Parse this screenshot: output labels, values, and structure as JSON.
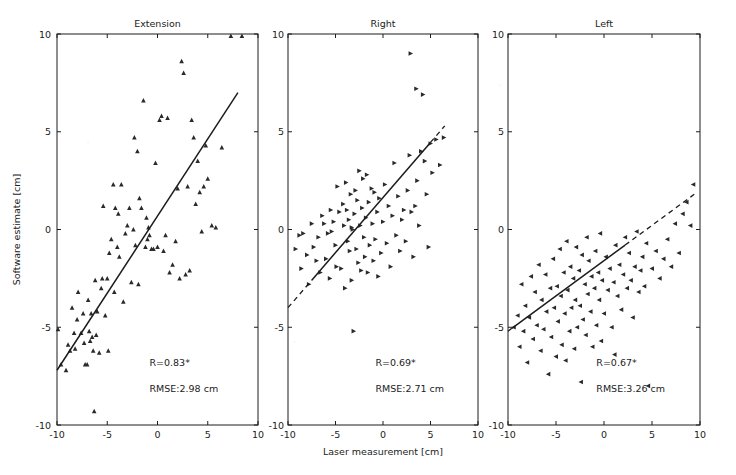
{
  "figure": {
    "width": 736,
    "height": 475,
    "background": "#ffffff",
    "ink_color": "#222222"
  },
  "axis": {
    "xlabel": "Laser measurement [cm]",
    "ylabel": "Software estimate [cm]",
    "xticks": [
      "-10",
      "-5",
      "0",
      "5",
      "10"
    ],
    "yticks": [
      "10",
      "5",
      "0",
      "-5",
      "-10"
    ],
    "xlim": [
      -10,
      10
    ],
    "ylim": [
      -10,
      10
    ]
  },
  "chart_data": {
    "type": "scatter",
    "title": "",
    "xlabel": "Laser measurement [cm]",
    "ylabel": "Software estimate [cm]",
    "xlim": [
      -10,
      10
    ],
    "ylim": [
      -10,
      10
    ],
    "grid": false,
    "legend": "none",
    "shared_axes": true,
    "panels": [
      {
        "title": "Extension",
        "marker": "triangle-up",
        "marker_color": "#2a2a2a",
        "r_label": "R=0.83*",
        "rmse_label": "RMSE:2.98 cm",
        "r_value": 0.83,
        "rmse_value": 2.98,
        "rmse_units": "cm",
        "significance": "*",
        "fit_line": {
          "style": "solid",
          "x_start": -10.0,
          "y_start": -7.2,
          "x_end": 8.0,
          "y_end": 7.0,
          "slope": 0.789,
          "intercept": 0.69
        },
        "points": [
          [
            -9.9,
            -5.1
          ],
          [
            -9.6,
            -6.9
          ],
          [
            -9.1,
            -7.2
          ],
          [
            -8.9,
            -5.9
          ],
          [
            -8.7,
            -6.2
          ],
          [
            -8.5,
            -4.0
          ],
          [
            -8.3,
            -5.3
          ],
          [
            -8.2,
            -6.1
          ],
          [
            -8.0,
            -4.6
          ],
          [
            -7.9,
            -3.2
          ],
          [
            -7.6,
            -5.3
          ],
          [
            -7.4,
            -4.3
          ],
          [
            -7.3,
            -5.8
          ],
          [
            -7.2,
            -6.9
          ],
          [
            -7.0,
            -6.9
          ],
          [
            -6.9,
            -3.6
          ],
          [
            -6.8,
            -5.2
          ],
          [
            -6.7,
            -5.7
          ],
          [
            -6.6,
            -4.3
          ],
          [
            -6.5,
            -5.5
          ],
          [
            -6.4,
            -6.2
          ],
          [
            -6.3,
            -9.3
          ],
          [
            -6.2,
            -2.6
          ],
          [
            -6.1,
            -5.4
          ],
          [
            -6.0,
            -4.2
          ],
          [
            -5.8,
            -6.3
          ],
          [
            -5.6,
            -3.0
          ],
          [
            -5.5,
            -2.5
          ],
          [
            -5.4,
            1.2
          ],
          [
            -5.2,
            -4.4
          ],
          [
            -5.0,
            -2.5
          ],
          [
            -4.9,
            -6.2
          ],
          [
            -4.8,
            -1.2
          ],
          [
            -4.6,
            -0.5
          ],
          [
            -4.4,
            2.3
          ],
          [
            -4.3,
            -3.2
          ],
          [
            -4.2,
            1.1
          ],
          [
            -4.0,
            -0.9
          ],
          [
            -3.9,
            0.8
          ],
          [
            -3.8,
            -1.4
          ],
          [
            -3.6,
            2.3
          ],
          [
            -3.4,
            -3.7
          ],
          [
            -3.2,
            -0.2
          ],
          [
            -3.0,
            0.2
          ],
          [
            -2.8,
            1.1
          ],
          [
            -2.6,
            -2.7
          ],
          [
            -2.4,
            0.0
          ],
          [
            -2.3,
            4.7
          ],
          [
            -2.2,
            -0.8
          ],
          [
            -2.0,
            4.0
          ],
          [
            -1.9,
            -2.8
          ],
          [
            -1.8,
            1.6
          ],
          [
            -1.6,
            1.1
          ],
          [
            -1.4,
            6.6
          ],
          [
            -1.2,
            -0.9
          ],
          [
            -1.1,
            0.6
          ],
          [
            -1.0,
            -0.5
          ],
          [
            -0.9,
            0.1
          ],
          [
            -0.8,
            -0.3
          ],
          [
            -0.6,
            -1.0
          ],
          [
            -0.4,
            -1.0
          ],
          [
            -0.2,
            3.4
          ],
          [
            0.0,
            -0.9
          ],
          [
            0.2,
            5.6
          ],
          [
            0.4,
            5.8
          ],
          [
            0.6,
            -1.1
          ],
          [
            0.8,
            -0.3
          ],
          [
            1.0,
            5.7
          ],
          [
            1.2,
            -2.2
          ],
          [
            1.5,
            -1.8
          ],
          [
            1.8,
            -0.6
          ],
          [
            2.0,
            2.1
          ],
          [
            2.2,
            -2.5
          ],
          [
            2.4,
            8.6
          ],
          [
            2.6,
            8.0
          ],
          [
            2.8,
            -2.3
          ],
          [
            3.0,
            2.2
          ],
          [
            3.2,
            -2.1
          ],
          [
            3.4,
            5.6
          ],
          [
            3.6,
            4.7
          ],
          [
            3.8,
            1.3
          ],
          [
            4.0,
            3.5
          ],
          [
            4.2,
            1.9
          ],
          [
            4.4,
            -0.1
          ],
          [
            4.6,
            2.2
          ],
          [
            4.8,
            4.3
          ],
          [
            5.0,
            2.6
          ],
          [
            5.4,
            0.2
          ],
          [
            5.8,
            0.1
          ],
          [
            6.4,
            4.2
          ],
          [
            7.3,
            9.9
          ],
          [
            8.4,
            9.9
          ]
        ]
      },
      {
        "title": "Right",
        "marker": "triangle-right",
        "marker_color": "#2a2a2a",
        "r_label": "R=0.69*",
        "rmse_label": "RMSE:2.71 cm",
        "r_value": 0.69,
        "rmse_value": 2.71,
        "rmse_units": "cm",
        "significance": "*",
        "fit_line": {
          "style": "solid-with-dashed-extensions",
          "x_start": -10.0,
          "y_start": -4.0,
          "x_end": 6.5,
          "y_end": 5.3,
          "solid_x_start": -7.5,
          "solid_x_end": 5.0,
          "slope": 0.564,
          "intercept": 1.64
        },
        "points": [
          [
            -9.2,
            -1.0
          ],
          [
            -8.8,
            -0.3
          ],
          [
            -8.6,
            -2.0
          ],
          [
            -8.4,
            -0.2
          ],
          [
            -8.0,
            -1.3
          ],
          [
            -7.8,
            -2.8
          ],
          [
            -7.5,
            0.3
          ],
          [
            -7.3,
            -0.9
          ],
          [
            -7.0,
            -1.6
          ],
          [
            -6.8,
            -0.4
          ],
          [
            -6.6,
            -2.2
          ],
          [
            -6.4,
            0.7
          ],
          [
            -6.2,
            0.3
          ],
          [
            -6.0,
            -1.5
          ],
          [
            -5.8,
            -0.2
          ],
          [
            -5.6,
            -2.5
          ],
          [
            -5.5,
            1.0
          ],
          [
            -5.4,
            -0.1
          ],
          [
            -5.2,
            0.4
          ],
          [
            -5.0,
            -0.8
          ],
          [
            -4.9,
            -1.9
          ],
          [
            -4.8,
            2.2
          ],
          [
            -4.6,
            0.9
          ],
          [
            -4.4,
            -2.0
          ],
          [
            -4.2,
            1.3
          ],
          [
            -4.1,
            0.2
          ],
          [
            -4.0,
            -3.0
          ],
          [
            -3.9,
            2.4
          ],
          [
            -3.8,
            1.0
          ],
          [
            -3.7,
            -0.6
          ],
          [
            -3.6,
            0.5
          ],
          [
            -3.5,
            -1.1
          ],
          [
            -3.4,
            1.8
          ],
          [
            -3.3,
            -2.6
          ],
          [
            -3.2,
            0.0
          ],
          [
            -3.1,
            -5.2
          ],
          [
            -3.0,
            0.8
          ],
          [
            -2.9,
            2.0
          ],
          [
            -2.8,
            -1.0
          ],
          [
            -2.7,
            1.5
          ],
          [
            -2.6,
            -1.7
          ],
          [
            -2.5,
            3.0
          ],
          [
            -2.4,
            0.2
          ],
          [
            -2.3,
            -2.1
          ],
          [
            -2.2,
            1.1
          ],
          [
            -2.1,
            2.6
          ],
          [
            -2.0,
            -0.4
          ],
          [
            -1.9,
            -1.4
          ],
          [
            -1.8,
            0.6
          ],
          [
            -1.7,
            2.8
          ],
          [
            -1.6,
            -2.2
          ],
          [
            -1.5,
            1.4
          ],
          [
            -1.4,
            -0.8
          ],
          [
            -1.2,
            2.1
          ],
          [
            -1.1,
            0.3
          ],
          [
            -1.0,
            -1.6
          ],
          [
            -0.9,
            1.9
          ],
          [
            -0.8,
            -0.5
          ],
          [
            -0.6,
            0.9
          ],
          [
            -0.5,
            -2.4
          ],
          [
            -0.4,
            1.6
          ],
          [
            -0.2,
            -1.2
          ],
          [
            0.0,
            0.4
          ],
          [
            0.2,
            2.3
          ],
          [
            0.4,
            -0.7
          ],
          [
            0.6,
            1.2
          ],
          [
            0.8,
            -1.9
          ],
          [
            1.0,
            0.7
          ],
          [
            1.2,
            3.4
          ],
          [
            1.4,
            -0.3
          ],
          [
            1.6,
            1.7
          ],
          [
            1.8,
            -1.1
          ],
          [
            2.0,
            0.5
          ],
          [
            2.2,
            1.0
          ],
          [
            2.4,
            -0.6
          ],
          [
            2.6,
            2.0
          ],
          [
            2.8,
            3.8
          ],
          [
            3.0,
            0.9
          ],
          [
            3.2,
            -1.4
          ],
          [
            3.4,
            1.2
          ],
          [
            3.6,
            2.5
          ],
          [
            3.8,
            0.2
          ],
          [
            4.0,
            4.0
          ],
          [
            4.2,
            6.9
          ],
          [
            4.4,
            3.5
          ],
          [
            4.6,
            1.8
          ],
          [
            4.8,
            -0.9
          ],
          [
            5.0,
            4.4
          ],
          [
            5.2,
            2.9
          ],
          [
            5.6,
            4.6
          ],
          [
            6.0,
            3.3
          ],
          [
            6.4,
            4.7
          ],
          [
            2.9,
            9.0
          ],
          [
            3.5,
            7.2
          ],
          [
            -3.3,
            0.1
          ]
        ]
      },
      {
        "title": "Left",
        "marker": "triangle-left",
        "marker_color": "#2a2a2a",
        "r_label": "R=0.67*",
        "rmse_label": "RMSE:3.26 cm",
        "r_value": 0.67,
        "rmse_value": 3.26,
        "rmse_units": "cm",
        "significance": "*",
        "fit_line": {
          "style": "solid-with-dashed-extensions",
          "x_start": -10.0,
          "y_start": -5.2,
          "x_end": 9.4,
          "y_end": 1.8,
          "solid_x_start": -9.6,
          "solid_x_end": 2.2,
          "slope": 0.361,
          "intercept": -1.59
        },
        "points": [
          [
            -9.4,
            -5.0
          ],
          [
            -9.0,
            -4.4
          ],
          [
            -8.8,
            -6.0
          ],
          [
            -8.6,
            -2.8
          ],
          [
            -8.4,
            -5.2
          ],
          [
            -8.2,
            -3.9
          ],
          [
            -8.0,
            -6.8
          ],
          [
            -7.8,
            -4.5
          ],
          [
            -7.6,
            -2.4
          ],
          [
            -7.4,
            -5.6
          ],
          [
            -7.2,
            -3.2
          ],
          [
            -7.0,
            -4.9
          ],
          [
            -6.8,
            -1.8
          ],
          [
            -6.6,
            -6.2
          ],
          [
            -6.5,
            -3.6
          ],
          [
            -6.3,
            -5.1
          ],
          [
            -6.1,
            -2.3
          ],
          [
            -6.0,
            -4.2
          ],
          [
            -5.8,
            -7.4
          ],
          [
            -5.6,
            -3.0
          ],
          [
            -5.5,
            -5.5
          ],
          [
            -5.3,
            -1.5
          ],
          [
            -5.2,
            -4.0
          ],
          [
            -5.0,
            -6.5
          ],
          [
            -4.9,
            -2.9
          ],
          [
            -4.8,
            -4.7
          ],
          [
            -4.6,
            -1.0
          ],
          [
            -4.5,
            -3.4
          ],
          [
            -4.4,
            -5.9
          ],
          [
            -4.2,
            -2.2
          ],
          [
            -4.1,
            -4.3
          ],
          [
            -4.0,
            -6.7
          ],
          [
            -3.9,
            -0.6
          ],
          [
            -3.8,
            -3.1
          ],
          [
            -3.6,
            -5.2
          ],
          [
            -3.5,
            -1.9
          ],
          [
            -3.4,
            -4.0
          ],
          [
            -3.2,
            -2.5
          ],
          [
            -3.1,
            -6.1
          ],
          [
            -3.0,
            -3.6
          ],
          [
            -2.9,
            -0.9
          ],
          [
            -2.8,
            -5.0
          ],
          [
            -2.6,
            -2.1
          ],
          [
            -2.5,
            -3.9
          ],
          [
            -2.4,
            -7.8
          ],
          [
            -2.3,
            -1.3
          ],
          [
            -2.2,
            -4.6
          ],
          [
            -2.0,
            -2.8
          ],
          [
            -1.9,
            -5.4
          ],
          [
            -1.8,
            -0.4
          ],
          [
            -1.7,
            -3.3
          ],
          [
            -1.6,
            -1.6
          ],
          [
            -1.4,
            -4.2
          ],
          [
            -1.3,
            -2.4
          ],
          [
            -1.2,
            -6.0
          ],
          [
            -1.0,
            -3.0
          ],
          [
            -0.9,
            -1.1
          ],
          [
            -0.8,
            -4.9
          ],
          [
            -0.6,
            -2.2
          ],
          [
            -0.5,
            -3.6
          ],
          [
            -0.4,
            -0.2
          ],
          [
            -0.2,
            -2.6
          ],
          [
            0.0,
            -4.3
          ],
          [
            0.2,
            -1.4
          ],
          [
            0.4,
            -3.1
          ],
          [
            0.6,
            -2.0
          ],
          [
            0.8,
            -5.0
          ],
          [
            1.0,
            -2.7
          ],
          [
            1.2,
            -0.8
          ],
          [
            1.4,
            -3.4
          ],
          [
            1.6,
            -1.8
          ],
          [
            1.8,
            -4.1
          ],
          [
            2.0,
            -2.3
          ],
          [
            2.2,
            -0.4
          ],
          [
            2.4,
            -3.0
          ],
          [
            2.6,
            -1.2
          ],
          [
            2.8,
            -2.6
          ],
          [
            3.0,
            -4.5
          ],
          [
            3.2,
            -1.9
          ],
          [
            3.4,
            -0.1
          ],
          [
            3.6,
            -3.2
          ],
          [
            3.8,
            -2.1
          ],
          [
            4.0,
            -1.4
          ],
          [
            4.2,
            -2.9
          ],
          [
            4.4,
            -0.7
          ],
          [
            4.6,
            -8.0
          ],
          [
            5.0,
            -2.0
          ],
          [
            5.4,
            -1.1
          ],
          [
            5.8,
            -2.5
          ],
          [
            6.2,
            -1.5
          ],
          [
            6.6,
            -0.5
          ],
          [
            7.0,
            -1.9
          ],
          [
            7.4,
            0.3
          ],
          [
            7.8,
            -1.2
          ],
          [
            8.2,
            0.8
          ],
          [
            8.6,
            1.4
          ],
          [
            9.0,
            0.2
          ],
          [
            9.3,
            2.3
          ],
          [
            -0.3,
            -5.7
          ],
          [
            1.1,
            -6.4
          ]
        ]
      }
    ]
  }
}
